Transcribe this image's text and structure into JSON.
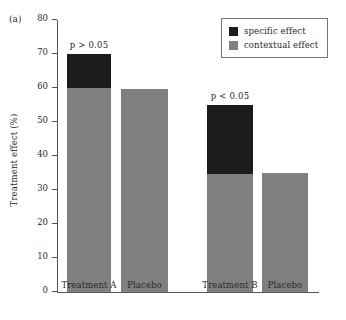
{
  "panel": {
    "label": "(a)"
  },
  "chart_data": {
    "type": "bar",
    "subtype": "stacked-bar",
    "title": "",
    "xlabel": "",
    "ylabel": "Treatment effect (%)",
    "ylim": [
      0,
      80
    ],
    "yticks": [
      0,
      10,
      20,
      30,
      40,
      50,
      60,
      70,
      80
    ],
    "ytick_labels": [
      "0",
      "10",
      "20",
      "30",
      "40",
      "50",
      "60",
      "70",
      "80"
    ],
    "grid": false,
    "legend_position": "top-right",
    "categories": [
      "Treatment A",
      "Placebo",
      "Treatment B",
      "Placebo"
    ],
    "series": [
      {
        "name": "contextual effect",
        "color": "#808080",
        "values": [
          60.0,
          59.8,
          34.8,
          35.0
        ]
      },
      {
        "name": "specific effect",
        "color": "#1c1c1c",
        "values": [
          10.0,
          0,
          20.2,
          0
        ]
      }
    ],
    "totals": [
      70.0,
      59.8,
      55.0,
      35.0
    ],
    "annotations": [
      {
        "text": "p > 0.05",
        "over_group": "Treatment A vs Placebo"
      },
      {
        "text": "p < 0.05",
        "over_group": "Treatment B vs Placebo"
      }
    ]
  },
  "legend": {
    "entries": [
      {
        "label": "specific effect",
        "color": "#1c1c1c"
      },
      {
        "label": "contextual effect",
        "color": "#808080"
      }
    ]
  },
  "colors": {
    "specific": "#1c1c1c",
    "contextual": "#808080",
    "axis": "#555555",
    "text": "#2a2a2a",
    "background": "#ffffff"
  },
  "caption_remnant": ""
}
